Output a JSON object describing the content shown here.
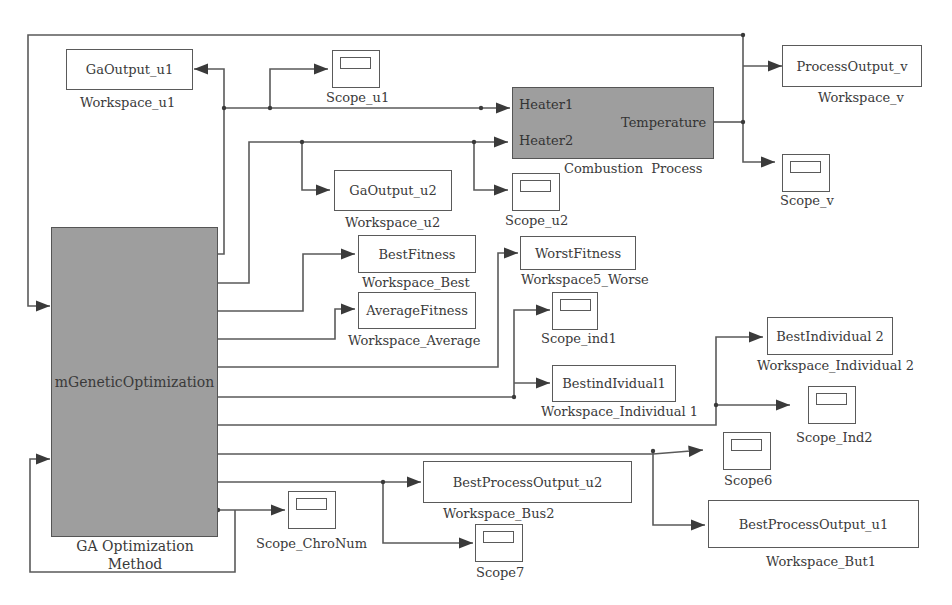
{
  "diagram": {
    "type": "Simulink block diagram",
    "blocks": {
      "ga": {
        "label": "mGeneticOptimization",
        "caption_line1": "GA Optimization",
        "caption_line2": "Method"
      },
      "process": {
        "in1": "Heater1",
        "in2": "Heater2",
        "out": "Temperature",
        "caption": "Combustion  Process"
      },
      "ga_out_u1": {
        "label": "GaOutput_u1",
        "caption": "Workspace_u1"
      },
      "ga_out_u2": {
        "label": "GaOutput_u2",
        "caption": "Workspace_u2"
      },
      "best_fitness": {
        "label": "BestFitness",
        "caption": "Workspace_Best"
      },
      "avg_fitness": {
        "label": "AverageFitness",
        "caption": "Workspace_Average"
      },
      "worst_fitness": {
        "label": "WorstFitness",
        "caption": "Workspace5_Worse"
      },
      "best_ind1": {
        "label": "BestindIvidual1",
        "caption": "Workspace_Individual 1"
      },
      "best_ind2": {
        "label": "BestIndividual 2",
        "caption": "Workspace_Individual 2"
      },
      "process_out_v": {
        "label": "ProcessOutput_v",
        "caption": "Workspace_v"
      },
      "best_proc_u2": {
        "label": "BestProcessOutput_u2",
        "caption": "Workspace_Bus2"
      },
      "best_proc_u1": {
        "label": "BestProcessOutput_u1",
        "caption": "Workspace_But1"
      }
    },
    "scopes": {
      "u1": "Scope_u1",
      "u2": "Scope_u2",
      "v": "Scope_v",
      "ind1": "Scope_ind1",
      "ind2": "Scope_Ind2",
      "s6": "Scope6",
      "s7": "Scope7",
      "chronum": "Scope_ChroNum"
    },
    "colors": {
      "block_gray": "#9e9e9e",
      "wire": "#555555",
      "text": "#3a3a3a"
    }
  }
}
